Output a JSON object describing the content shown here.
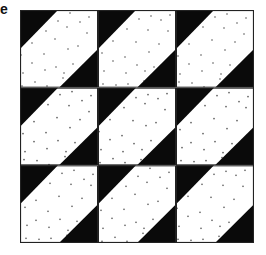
{
  "label": "e",
  "figure": {
    "rows": 3,
    "cols": 3,
    "colors": {
      "dark": "#0a0a0a",
      "light": "#ffffff",
      "dot": "#555555",
      "border": "#222222"
    }
  }
}
